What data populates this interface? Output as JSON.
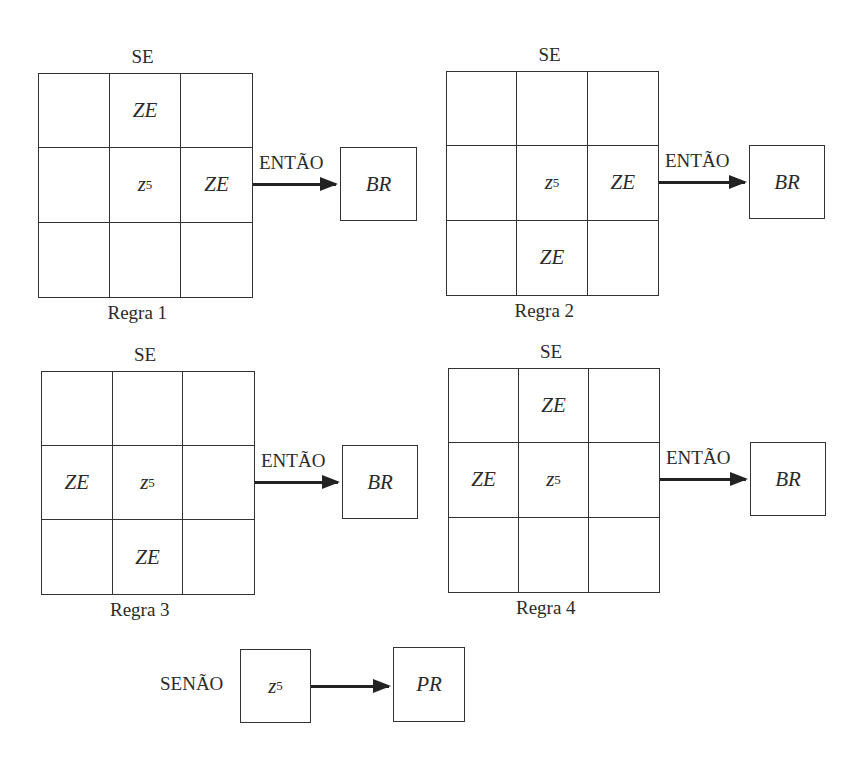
{
  "labels": {
    "if": "SE",
    "then": "ENTÃO",
    "else": "SENÃO",
    "center_var": "z",
    "center_sub": "5",
    "neighbor_value": "ZE",
    "then_output": "BR",
    "else_output": "PR"
  },
  "rules": [
    {
      "title": "Regra 1",
      "grid": [
        [
          "",
          "ZE",
          ""
        ],
        [
          "",
          "z5",
          "ZE"
        ],
        [
          "",
          "",
          ""
        ]
      ],
      "output": "BR"
    },
    {
      "title": "Regra 2",
      "grid": [
        [
          "",
          "",
          ""
        ],
        [
          "",
          "z5",
          "ZE"
        ],
        [
          "",
          "ZE",
          ""
        ]
      ],
      "output": "BR"
    },
    {
      "title": "Regra 3",
      "grid": [
        [
          "",
          "",
          ""
        ],
        [
          "ZE",
          "z5",
          ""
        ],
        [
          "",
          "ZE",
          ""
        ]
      ],
      "output": "BR"
    },
    {
      "title": "Regra 4",
      "grid": [
        [
          "",
          "ZE",
          ""
        ],
        [
          "ZE",
          "z5",
          ""
        ],
        [
          "",
          "",
          ""
        ]
      ],
      "output": "BR"
    }
  ],
  "else_rule": {
    "label": "SENÃO",
    "input": "z5",
    "output": "PR"
  }
}
